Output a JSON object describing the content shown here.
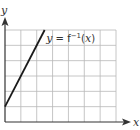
{
  "chart_data": {
    "type": "line",
    "title": "",
    "xlabel": "x",
    "ylabel": "y",
    "grid": true,
    "xlim": [
      0,
      7
    ],
    "ylim": [
      0,
      6
    ],
    "tick_labels": false,
    "series": [
      {
        "name": "y = f⁻¹(x)",
        "x": [
          0,
          2.5
        ],
        "y": [
          1,
          6
        ]
      }
    ],
    "annotations": [
      {
        "text_prefix": "y = f",
        "superscript": "−1",
        "text_suffix": "(x)",
        "x": 2.6,
        "y": 5.5
      }
    ]
  }
}
